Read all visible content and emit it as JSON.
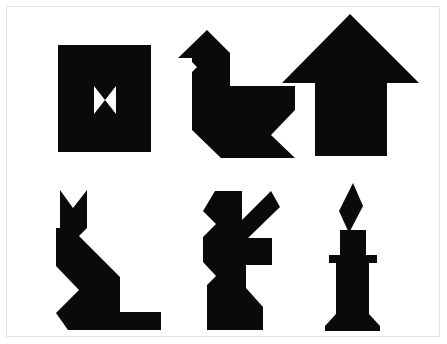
{
  "page": {
    "background_color": "#ffffff",
    "frame_color": "#e3e3e3",
    "shape_color": "#0a0a0a",
    "width": 447,
    "height": 344
  },
  "figures": [
    {
      "id": "square-bowtie",
      "name": "Square with bowtie cutout",
      "row": 1,
      "column": 1,
      "fill": "#0a0a0a",
      "outline_points": "58,45 151,45 151,152 58,152",
      "cutout_points": "94,86 105,100 94,114 94,86 116,86 105,100 116,114 116,86"
    },
    {
      "id": "swan",
      "name": "Swan",
      "row": 1,
      "column": 2,
      "fill": "#0a0a0a",
      "outline_points": "178,58 207,30 230,53 230,86 295,86 295,110 271,135 295,158 221,158 192,130 192,86 192,72 197,67 192,62 192,58"
    },
    {
      "id": "arrow-up",
      "name": "Upward arrow",
      "row": 1,
      "column": 3,
      "fill": "#0a0a0a",
      "outline_points": "350,14 419,83 387,83 387,156 315,156 315,83 282,83"
    },
    {
      "id": "cat",
      "name": "Sitting cat",
      "row": 2,
      "column": 1,
      "fill": "#0a0a0a",
      "outline_points": "60,190 73,208 87,190 87,228 79,236 120,277 120,312 161,312 161,330 68,330 56,313 79,290 56,266 56,228 60,228"
    },
    {
      "id": "rabbit",
      "name": "Rabbit",
      "row": 2,
      "column": 2,
      "fill": "#0a0a0a",
      "outline_points": "215,191 242,191 242,220 271,191 280,207 248,238 272,238 272,265 246,265 246,288 263,307 263,330 207,330 207,285 216,276 203,262 203,237 216,224 203,211"
    },
    {
      "id": "candle",
      "name": "Lit candle",
      "row": 2,
      "column": 3,
      "fill": "#0a0a0a",
      "outline_points": "353,183 363,206 349,233 339,211",
      "body_points": "340,230 366,230 366,255 377,255 377,263 369,263 369,314 380,326 380,331 325,331 325,326 336,314 336,263 329,263 329,255 340,255"
    }
  ]
}
